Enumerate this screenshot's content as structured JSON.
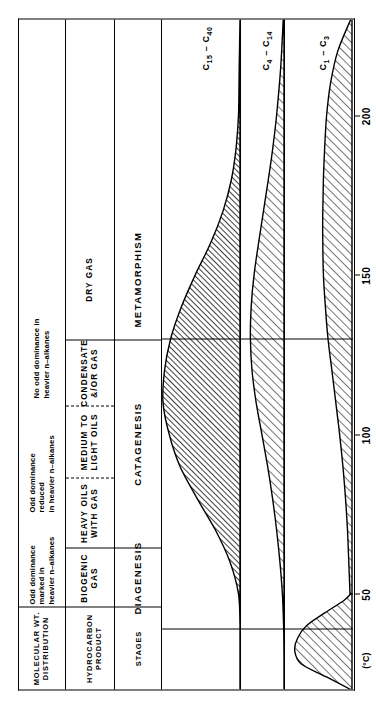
{
  "figure": {
    "orientation": "rotated-90-ccw",
    "title": ""
  },
  "row_headers": [
    {
      "id": "molecular-wt",
      "label": "MOLECULAR  WT.\nDISTRIBUTION"
    },
    {
      "id": "hydrocarbon-product",
      "label": "HYDROCARBON PRODUCT"
    },
    {
      "id": "stages",
      "label": "STAGES"
    }
  ],
  "molecular_wt_row": {
    "cells": [
      {
        "id": "odd-dominance-marked",
        "text": "Odd dominance marked in\nheavier n–alkanes"
      },
      {
        "id": "odd-dominance-reduced",
        "text": "Odd dominance reduced\nin heavier n–alkanes"
      },
      {
        "id": "no-odd-dominance",
        "text": "No odd  dominance in\nheavier  n–alkanes"
      },
      {
        "id": "mw-blank",
        "text": ""
      }
    ]
  },
  "hydrocarbon_product_row": {
    "cells": [
      {
        "id": "biogenic-gas",
        "text": "BIOGENIC GAS"
      },
      {
        "id": "heavy-oils-with-gas",
        "text": "HEAVY OILS WITH GAS"
      },
      {
        "id": "medium-to-light-oils",
        "text": "MEDIUM TO LIGHT OILS"
      },
      {
        "id": "condensate-and-or-gas",
        "text": "CONDENSATE &/OR GAS"
      },
      {
        "id": "dry-gas",
        "text": "DRY GAS"
      }
    ]
  },
  "stages_row": {
    "cells": [
      {
        "id": "diagenesis",
        "text": "DIAGENESIS"
      },
      {
        "id": "catagenesis",
        "text": "CATAGENESIS"
      },
      {
        "id": "metamorphism",
        "text": "METAMORPHISM"
      }
    ]
  },
  "series_labels": [
    {
      "id": "c15-c40",
      "main": "C",
      "sub1": "15",
      "dash": " – ",
      "main2": "C",
      "sub2": "40"
    },
    {
      "id": "c4-c14",
      "main": "C",
      "sub1": "4",
      "dash": " – ",
      "main2": "C",
      "sub2": "14"
    },
    {
      "id": "c1-c3",
      "main": "C",
      "sub1": "1",
      "dash": " – ",
      "main2": "C",
      "sub2": "3"
    }
  ],
  "axis": {
    "unit_label": "(°C)",
    "ticks": [
      {
        "value": 50,
        "label": "50"
      },
      {
        "value": 100,
        "label": "100"
      },
      {
        "value": 150,
        "label": "150"
      },
      {
        "value": 200,
        "label": "200"
      }
    ],
    "range": [
      20,
      230
    ]
  },
  "chart_data": {
    "type": "area",
    "xlabel": "(°C)",
    "ylabel": "Relative amount of hydrocarbons generated",
    "xlim": [
      20,
      230
    ],
    "grid": false,
    "legend": "right",
    "stage_boundaries": [
      {
        "temperature": 50,
        "label": "DIAGENESIS / CATAGENESIS"
      },
      {
        "temperature": 160,
        "label": "CATAGENESIS / METAMORPHISM"
      }
    ],
    "series": [
      {
        "name": "C15 – C40",
        "panel": 0,
        "hatch": "diagonal-dense",
        "x": [
          20,
          30,
          40,
          50,
          60,
          70,
          80,
          90,
          100,
          110,
          120,
          130,
          140,
          150,
          160,
          170,
          180,
          190,
          200,
          215,
          230
        ],
        "values": [
          0,
          0,
          0,
          2,
          13,
          32,
          56,
          78,
          92,
          100,
          98,
          90,
          76,
          58,
          38,
          22,
          11,
          5,
          2,
          1,
          0
        ]
      },
      {
        "name": "C4 – C14",
        "panel": 1,
        "hatch": "diagonal-sparse",
        "x": [
          20,
          30,
          40,
          50,
          60,
          70,
          80,
          90,
          100,
          110,
          120,
          130,
          140,
          150,
          160,
          170,
          180,
          190,
          200,
          215,
          230
        ],
        "values": [
          0,
          0,
          1,
          4,
          10,
          18,
          28,
          40,
          54,
          68,
          78,
          82,
          80,
          73,
          62,
          50,
          38,
          27,
          18,
          8,
          2
        ]
      },
      {
        "name": "C1 – C3 (biogenic peak)",
        "panel": 2,
        "hatch": "diagonal-sparse",
        "x": [
          20,
          24,
          28,
          32,
          36,
          40,
          44,
          48,
          50
        ],
        "values": [
          2,
          40,
          78,
          88,
          84,
          70,
          42,
          12,
          2
        ]
      },
      {
        "name": "C1 – C3 (thermal)",
        "panel": 2,
        "hatch": "diagonal-sparse",
        "x": [
          50,
          60,
          70,
          80,
          90,
          100,
          110,
          120,
          130,
          140,
          150,
          160,
          170,
          180,
          190,
          200,
          210,
          220,
          230
        ],
        "values": [
          3,
          5,
          7,
          10,
          14,
          19,
          25,
          31,
          37,
          41,
          44,
          45,
          45,
          44,
          42,
          39,
          33,
          22,
          2
        ]
      }
    ]
  }
}
